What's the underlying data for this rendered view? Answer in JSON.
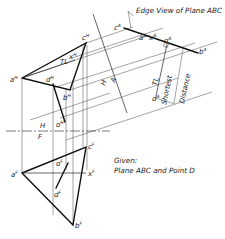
{
  "diagram": {
    "title_note": "Edge View of Plane ABC",
    "given": {
      "heading": "Given:",
      "text": "Plane ABC and Point D"
    },
    "fold_lines": {
      "h_f": {
        "top": "H",
        "bottom": "F"
      },
      "h_a": {
        "left": "H",
        "right": "A"
      }
    },
    "labels": {
      "shortest": "Shortest",
      "distance": "Distance",
      "tl_aux": "TL",
      "tl_horizontal": "TL"
    },
    "points": {
      "horizontal_view": {
        "a": {
          "base": "a",
          "sup": "H"
        },
        "b": {
          "base": "b",
          "sup": "H"
        },
        "c": {
          "base": "c",
          "sup": "H"
        },
        "d": {
          "base": "d",
          "sup": "H"
        },
        "x": {
          "base": "x",
          "sup": "H"
        },
        "o": {
          "base": "o",
          "sup": "H"
        }
      },
      "auxiliary_view": {
        "a": {
          "base": "a",
          "sup": "A"
        },
        "b": {
          "base": "b",
          "sup": "A"
        },
        "c": {
          "base": "c",
          "sup": "A"
        },
        "d": {
          "base": "d",
          "sup": "A"
        },
        "x": {
          "base": "x",
          "sup": "A"
        },
        "o": {
          "base": "o",
          "sup": "A"
        }
      },
      "frontal_view": {
        "a": {
          "base": "a",
          "sup": "F"
        },
        "b": {
          "base": "b",
          "sup": "F"
        },
        "c": {
          "base": "c",
          "sup": "F"
        },
        "d": {
          "base": "d",
          "sup": "F"
        },
        "x": {
          "base": "x",
          "sup": "F"
        },
        "o": {
          "base": "o",
          "sup": "F"
        }
      }
    },
    "colors": {
      "ink": "#111111",
      "paper": "#ffffff"
    }
  }
}
